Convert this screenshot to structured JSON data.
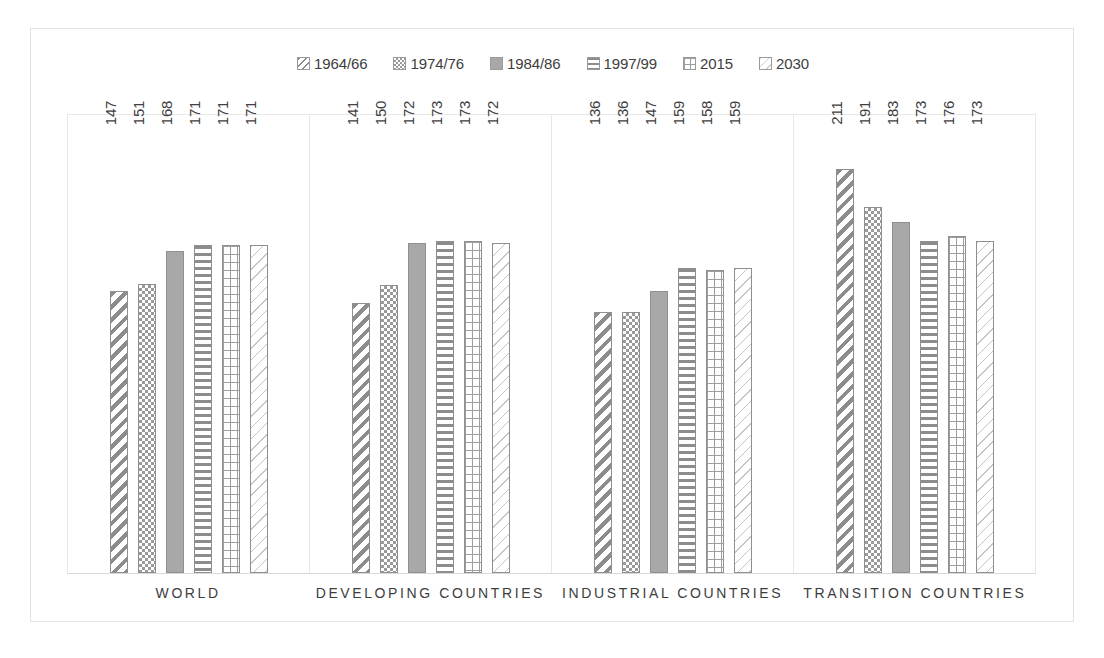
{
  "chart_data": {
    "type": "bar",
    "title": "",
    "subtitle": "",
    "xlabel": "",
    "ylabel": "",
    "grid": false,
    "legend_position": "top",
    "ylim": [
      0,
      240
    ],
    "categories": [
      "WORLD",
      "DEVELOPING COUNTRIES",
      "INDUSTRIAL COUNTRIES",
      "TRANSITION COUNTRIES"
    ],
    "series": [
      {
        "name": "1964/66",
        "pattern": "diagonal-stripes",
        "values": [
          147,
          141,
          136,
          211
        ]
      },
      {
        "name": "1974/76",
        "pattern": "checkerboard",
        "values": [
          151,
          150,
          136,
          191
        ]
      },
      {
        "name": "1984/86",
        "pattern": "solid-gray",
        "values": [
          168,
          172,
          147,
          183
        ]
      },
      {
        "name": "1997/99",
        "pattern": "horizontal-stripes",
        "values": [
          171,
          173,
          159,
          173
        ]
      },
      {
        "name": "2015",
        "pattern": "grid",
        "values": [
          171,
          173,
          158,
          176
        ]
      },
      {
        "name": "2030",
        "pattern": "light-wave",
        "values": [
          171,
          172,
          159,
          173
        ]
      }
    ],
    "legend": [
      "1964/66",
      "1974/76",
      "1984/86",
      "1997/99",
      "2015",
      "2030"
    ],
    "annotations": [],
    "colors": {
      "pattern_ink": "#8c8c8c",
      "solid_fill": "#a8a8a8",
      "bar_outline": "#8f8f8f",
      "label_text": "#404040",
      "axis_line": "#d9d9d9",
      "frame": "#e2e2e2",
      "background": "#ffffff"
    }
  }
}
